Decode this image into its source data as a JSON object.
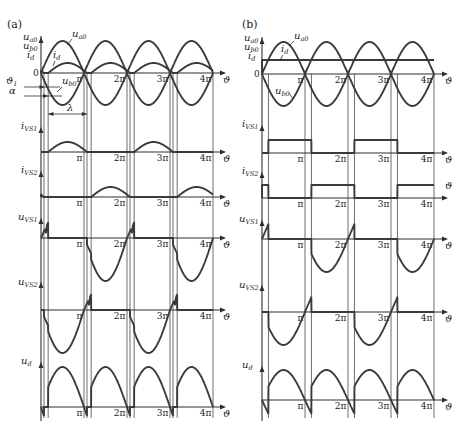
{
  "figure": {
    "axis_variable": "ϑ",
    "zero_label": "0",
    "tick_labels": [
      "π",
      "2π",
      "3π",
      "4π"
    ],
    "panels": [
      {
        "label": "(a)",
        "rows": [
          {
            "key": "sources",
            "labels": [
              {
                "main": "u",
                "sub": "a0"
              },
              {
                "main": "u",
                "sub": "b0"
              },
              {
                "main": "i",
                "sub": "d"
              }
            ]
          },
          {
            "key": "i_VS1",
            "labels": [
              {
                "main": "i",
                "sub": "VS1"
              }
            ]
          },
          {
            "key": "i_VS2",
            "labels": [
              {
                "main": "i",
                "sub": "VS2"
              }
            ]
          },
          {
            "key": "u_VS1",
            "labels": [
              {
                "main": "u",
                "sub": "VS1"
              }
            ]
          },
          {
            "key": "u_VS2",
            "labels": [
              {
                "main": "u",
                "sub": "VS2"
              }
            ]
          },
          {
            "key": "u_d",
            "labels": [
              {
                "main": "u",
                "sub": "d"
              }
            ]
          }
        ],
        "curve_labels": {
          "u_a0": {
            "main": "u",
            "sub": "a0"
          },
          "i_d": {
            "main": "i",
            "sub": "d"
          },
          "u_b0": {
            "main": "u",
            "sub": "b0"
          }
        },
        "annotations": {
          "theta1": {
            "main": "ϑ",
            "sub": "1"
          },
          "alpha": "α",
          "lambda": "λ"
        },
        "waveforms": {
          "mode": "discontinuous",
          "alpha_deg": 30,
          "delta_deg": 12.5,
          "u_a0": {
            "shape": "sine",
            "amp": 32
          },
          "u_b0": {
            "shape": "negative sine",
            "amp": 32
          },
          "i_d": {
            "shape": "half-sine pulses from alpha to pi+delta",
            "amp": 10
          },
          "i_VS1": {
            "shape": "half-sine pulses, even half-periods",
            "amp": 10
          },
          "i_VS2": {
            "shape": "half-sine pulses, odd half-periods",
            "amp": 10
          },
          "u_VS1": {
            "forward_amp": 31,
            "reverse_amp": 43
          },
          "u_VS2": {
            "forward_amp": 31,
            "reverse_amp": 43,
            "shift_deg": 180
          },
          "u_d": {
            "amp": 40
          }
        }
      },
      {
        "label": "(b)",
        "rows": [
          {
            "key": "sources",
            "labels": [
              {
                "main": "u",
                "sub": "a0"
              },
              {
                "main": "u",
                "sub": "b0"
              },
              {
                "main": "i",
                "sub": "d"
              }
            ]
          },
          {
            "key": "i_VS1",
            "labels": [
              {
                "main": "i",
                "sub": "VS1"
              }
            ]
          },
          {
            "key": "i_VS2",
            "labels": [
              {
                "main": "i",
                "sub": "VS2"
              }
            ]
          },
          {
            "key": "u_VS1",
            "labels": [
              {
                "main": "u",
                "sub": "VS1"
              }
            ]
          },
          {
            "key": "u_VS2",
            "labels": [
              {
                "main": "u",
                "sub": "VS2"
              }
            ]
          },
          {
            "key": "u_d",
            "labels": [
              {
                "main": "u",
                "sub": "d"
              }
            ]
          }
        ],
        "curve_labels": {
          "u_a0": {
            "main": "u",
            "sub": "a0"
          },
          "i_d": {
            "main": "i",
            "sub": "d"
          },
          "u_b0": {
            "main": "u",
            "sub": "b0"
          }
        },
        "waveforms": {
          "mode": "continuous (constant i_d)",
          "alpha_deg": 27,
          "u_a0": {
            "shape": "sine",
            "amp": 32
          },
          "u_b0": {
            "shape": "negative sine",
            "amp": 32
          },
          "i_d": {
            "shape": "constant",
            "level": 14
          },
          "i_VS1": {
            "shape": "rectangular, 180° from alpha",
            "level": 13
          },
          "i_VS2": {
            "shape": "rectangular, 180° from pi+alpha",
            "level": 13
          },
          "u_VS1": {
            "amp": 33
          },
          "u_VS2": {
            "amp": 33,
            "shift_deg": 180
          },
          "u_d": {
            "amp": 30
          }
        }
      }
    ]
  }
}
